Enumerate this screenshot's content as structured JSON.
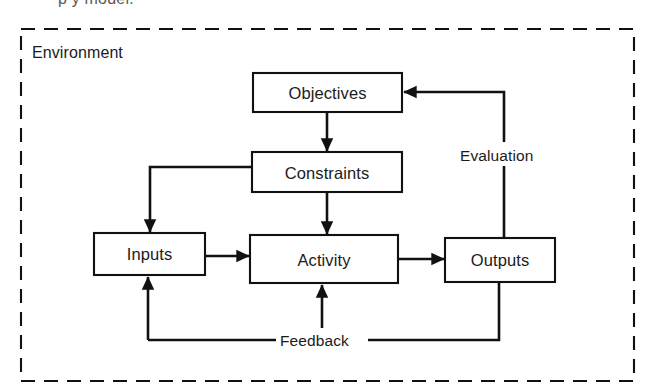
{
  "figure": {
    "clipped_caption_above": "p  y        model.",
    "environment_label": "Environment",
    "diagram_type": "block-flow-diagram"
  },
  "nodes": [
    {
      "id": "objectives",
      "label": "Objectives",
      "x": 253,
      "y": 73,
      "w": 149,
      "h": 39
    },
    {
      "id": "constraints",
      "label": "Constraints",
      "x": 252,
      "y": 152,
      "w": 150,
      "h": 40
    },
    {
      "id": "inputs",
      "label": "Inputs",
      "x": 94,
      "y": 233,
      "w": 111,
      "h": 42
    },
    {
      "id": "activity",
      "label": "Activity",
      "x": 250,
      "y": 235,
      "w": 148,
      "h": 48
    },
    {
      "id": "outputs",
      "label": "Outputs",
      "x": 445,
      "y": 238,
      "w": 110,
      "h": 44
    }
  ],
  "edges": [
    {
      "id": "objectives-to-constraints",
      "from": "objectives",
      "to": "constraints",
      "label": ""
    },
    {
      "id": "constraints-to-activity",
      "from": "constraints",
      "to": "activity",
      "label": ""
    },
    {
      "id": "constraints-to-inputs",
      "from": "constraints",
      "to": "inputs",
      "label": ""
    },
    {
      "id": "inputs-to-activity",
      "from": "inputs",
      "to": "activity",
      "label": ""
    },
    {
      "id": "activity-to-outputs",
      "from": "activity",
      "to": "outputs",
      "label": ""
    },
    {
      "id": "outputs-to-objectives",
      "from": "outputs",
      "to": "objectives",
      "label": "Evaluation"
    },
    {
      "id": "outputs-to-activity",
      "from": "outputs",
      "to": "activity",
      "label": "Feedback"
    },
    {
      "id": "outputs-to-inputs",
      "from": "outputs",
      "to": "inputs",
      "label": "Feedback"
    }
  ],
  "edge_labels": {
    "evaluation": "Evaluation",
    "feedback": "Feedback"
  },
  "colors": {
    "ink": "#111111",
    "paper": "#ffffff",
    "text": "#1b1b1b"
  }
}
